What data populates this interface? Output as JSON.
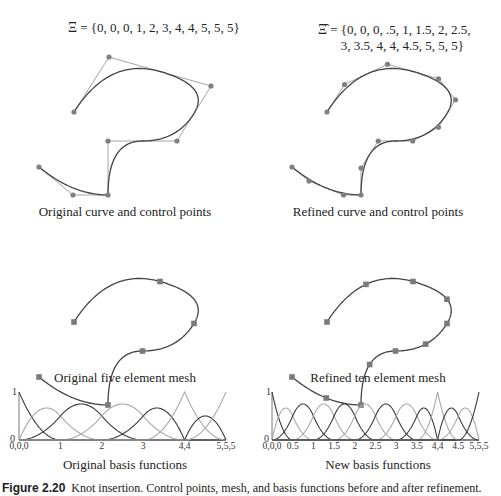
{
  "degree": 2,
  "original": {
    "knot_label_symbol": "Ξ",
    "knot_label_text": " = {0, 0, 0, 1, 2, 3, 4, 4, 5, 5, 5}",
    "knots": [
      0,
      0,
      0,
      1,
      2,
      3,
      4,
      4,
      5,
      5,
      5
    ],
    "control_points": [
      [
        74,
        112
      ],
      [
        109,
        57
      ],
      [
        211,
        86
      ],
      [
        177,
        141
      ],
      [
        108,
        141
      ],
      [
        108,
        195
      ],
      [
        73,
        195
      ],
      [
        39,
        167
      ]
    ],
    "curve_caption": "Original curve and control points",
    "mesh_offset_y": 210,
    "mesh_caption": "Original five element mesh",
    "basis_caption": "Original basis functions",
    "basis_ticks": [
      {
        "x": 0,
        "label": "0,0,0"
      },
      {
        "x": 1,
        "label": "1"
      },
      {
        "x": 2,
        "label": "2"
      },
      {
        "x": 3,
        "label": "3"
      },
      {
        "x": 4,
        "label": "4,4"
      },
      {
        "x": 5,
        "label": "5,5,5"
      }
    ]
  },
  "refined": {
    "knot_label_symbol": "Ξ̂",
    "knot_label_line1": " = {0, 0, 0, .5, 1, 1.5, 2, 2.5,",
    "knot_label_line2": "3, 3.5, 4, 4, 4.5, 5, 5, 5}",
    "knots": [
      0,
      0,
      0,
      0.5,
      1,
      1.5,
      2,
      2.5,
      3,
      3.5,
      4,
      4,
      4.5,
      5,
      5,
      5
    ],
    "curve_caption": "Refined curve and control points",
    "mesh_caption": "Refined ten element mesh",
    "basis_caption": "New basis functions",
    "basis_ticks": [
      {
        "x": 0,
        "label": "0,0,0"
      },
      {
        "x": 0.5,
        "label": "0.5"
      },
      {
        "x": 1,
        "label": "1"
      },
      {
        "x": 1.5,
        "label": "1.5"
      },
      {
        "x": 2,
        "label": "2"
      },
      {
        "x": 2.5,
        "label": "2.5"
      },
      {
        "x": 3,
        "label": "3"
      },
      {
        "x": 3.5,
        "label": "3.5"
      },
      {
        "x": 4,
        "label": "4,4"
      },
      {
        "x": 4.5,
        "label": "4.5"
      },
      {
        "x": 5,
        "label": "5,5,5"
      }
    ]
  },
  "panel_offset_x": 253,
  "basis_axis": {
    "y_top_label": "1",
    "y_bottom_label": "0"
  },
  "figure_caption": {
    "label": "Figure 2.20",
    "text": "Knot insertion. Control points, mesh, and basis functions before and after refinement."
  },
  "colors": {
    "curve": "#444444",
    "control_polygon": "#9a9a9a",
    "control_point": "#808080",
    "mesh_node": "#7a7a7a",
    "basis_dark": "#3a3a3a",
    "basis_light": "#a8a8a8",
    "axis": "#555555"
  }
}
